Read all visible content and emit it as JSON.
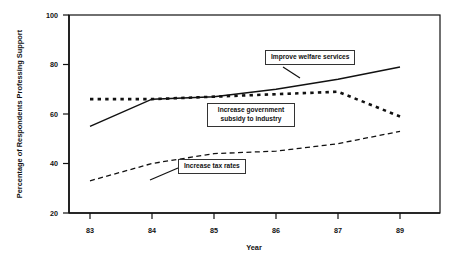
{
  "chart_data": {
    "type": "line",
    "title": "",
    "xlabel": "Year",
    "ylabel": "Percentage of Respondents Professing Support",
    "x": [
      "83",
      "84",
      "85",
      "86",
      "87",
      "89"
    ],
    "xtick_labels": [
      "83",
      "84",
      "85",
      "86",
      "87",
      "89"
    ],
    "ytick_labels": [
      "20",
      "40",
      "60",
      "80",
      "100"
    ],
    "ylim": [
      20,
      100
    ],
    "grid": false,
    "legend_position": "inline-callouts",
    "series": [
      {
        "name": "Improve welfare services",
        "style": "solid",
        "values": [
          55,
          66,
          67,
          70,
          74,
          79
        ]
      },
      {
        "name": "Increase government subsidy to industry",
        "style": "dotted",
        "values": [
          66,
          66,
          67,
          68,
          69,
          59
        ]
      },
      {
        "name": "Increase tax rates",
        "style": "dashed",
        "values": [
          33,
          40,
          44,
          45,
          48,
          53
        ]
      }
    ],
    "annotations": [
      {
        "id": "welfare",
        "text": "Improve welfare services"
      },
      {
        "id": "subsidy",
        "line1": "Increase government",
        "line2": "subsidy to industry"
      },
      {
        "id": "tax",
        "text": "Increase tax rates"
      }
    ]
  },
  "axes": {
    "y_title": "Percentage of Respondents Professing Support",
    "x_title": "Year",
    "y_ticks": {
      "t100": "100",
      "t80": "80",
      "t60": "60",
      "t40": "40",
      "t20": "20"
    },
    "x_ticks": {
      "t83": "83",
      "t84": "84",
      "t85": "85",
      "t86": "86",
      "t87": "87",
      "t89": "89"
    }
  },
  "colors": {
    "ink": "#111111",
    "background": "#ffffff",
    "callout_border": "#333333"
  }
}
